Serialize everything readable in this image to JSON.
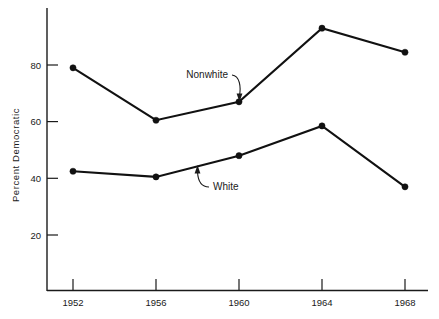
{
  "chart_data": {
    "type": "line",
    "title": "",
    "xlabel": "",
    "ylabel": "Percent Democratic",
    "categories": [
      "1952",
      "1956",
      "1960",
      "1964",
      "1968"
    ],
    "x": [
      1952,
      1956,
      1960,
      1964,
      1968
    ],
    "xlim": [
      1950.7,
      1969.6
    ],
    "ylim": [
      0,
      100
    ],
    "yticks": [
      "20",
      "40",
      "60",
      "80"
    ],
    "ytick_values": [
      20,
      40,
      60,
      80
    ],
    "grid": false,
    "legend_position": "inline-annotations",
    "series": [
      {
        "name": "Nonwhite",
        "values": [
          79,
          60.5,
          67,
          93,
          84.5
        ]
      },
      {
        "name": "White",
        "values": [
          42.5,
          40.5,
          48,
          58.5,
          37
        ]
      }
    ],
    "annotations": [
      {
        "text": "Nonwhite",
        "points_to_series": "Nonwhite",
        "points_to_x": 1960
      },
      {
        "text": "White",
        "points_to_series": "White",
        "points_to_x": 1960
      }
    ]
  },
  "axis": {
    "y_title": "Percent Democratic",
    "y_tick_labels": [
      "80",
      "60",
      "40",
      "20"
    ],
    "x_tick_labels": [
      "1952",
      "1956",
      "1960",
      "1964",
      "1968"
    ]
  },
  "annotations": {
    "nonwhite_label": "Nonwhite",
    "white_label": "White"
  },
  "colors": {
    "ink": "#111111",
    "background": "#ffffff"
  }
}
